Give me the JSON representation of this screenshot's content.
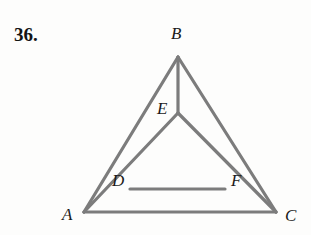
{
  "figure": {
    "problem_number": "36.",
    "background_color": "#fdfdfc",
    "stroke_color": "#7c7c7c",
    "stroke_width": 3.2,
    "label_color": "#1a1a1a",
    "width": 311,
    "height": 235,
    "labels": {
      "A": "A",
      "B": "B",
      "C": "C",
      "D": "D",
      "E": "E",
      "F": "F"
    },
    "points": {
      "A": {
        "x": 84,
        "y": 212
      },
      "B": {
        "x": 178,
        "y": 57
      },
      "C": {
        "x": 276,
        "y": 212
      },
      "D": {
        "x": 130,
        "y": 189
      },
      "E": {
        "x": 178,
        "y": 113
      },
      "F": {
        "x": 225,
        "y": 189
      }
    },
    "segments": [
      {
        "name": "side-AB",
        "from": "A",
        "to": "B"
      },
      {
        "name": "side-BC",
        "from": "B",
        "to": "C"
      },
      {
        "name": "side-AC",
        "from": "A",
        "to": "C"
      },
      {
        "name": "cevian-AE",
        "from": "A",
        "to": "E"
      },
      {
        "name": "cevian-CE",
        "from": "C",
        "to": "E"
      },
      {
        "name": "cevian-BE",
        "from": "B",
        "to": "E"
      },
      {
        "name": "inner-DF",
        "from": "D",
        "to": "F"
      }
    ]
  }
}
